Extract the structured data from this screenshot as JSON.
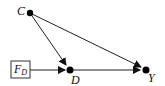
{
  "diagram": {
    "type": "causal-dag",
    "nodes": [
      {
        "id": "C",
        "label": "C"
      },
      {
        "id": "FD",
        "label": "F",
        "subscript": "D",
        "shape": "box"
      },
      {
        "id": "D",
        "label": "D"
      },
      {
        "id": "Y",
        "label": "Y"
      }
    ],
    "edges": [
      {
        "from": "C",
        "to": "D"
      },
      {
        "from": "C",
        "to": "Y"
      },
      {
        "from": "FD",
        "to": "D"
      },
      {
        "from": "D",
        "to": "Y"
      }
    ]
  },
  "colors": {
    "stroke": "#222222",
    "node": "#000000"
  }
}
